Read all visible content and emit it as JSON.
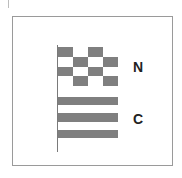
{
  "diagram": {
    "colors": {
      "dark": "#7f7f7f",
      "light": "#ffffff"
    },
    "flags": [
      {
        "id": "n",
        "label": "N",
        "pattern": "checkered",
        "rows": 4,
        "cols": 4,
        "first_cell": "dark"
      },
      {
        "id": "c",
        "label": "C",
        "pattern": "horizontal-stripes",
        "stripes": [
          "dark",
          "light",
          "dark",
          "light",
          "dark"
        ]
      }
    ]
  }
}
